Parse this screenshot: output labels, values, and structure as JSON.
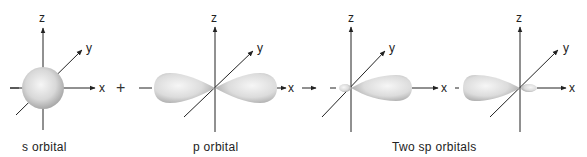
{
  "figure": {
    "panels": [
      {
        "id": "s",
        "label": "s orbital",
        "axes": {
          "x": "x",
          "y": "y",
          "z": "z"
        }
      },
      {
        "id": "p",
        "label": "p orbital",
        "axes": {
          "x": "x",
          "y": "y",
          "z": "z"
        }
      },
      {
        "id": "sp1",
        "axes": {
          "x": "x",
          "y": "y",
          "z": "z"
        }
      },
      {
        "id": "sp2",
        "axes": {
          "x": "x",
          "y": "y",
          "z": "z"
        }
      }
    ],
    "sp_label": "Two sp orbitals",
    "operators": {
      "plus": "+",
      "arrow": "→"
    },
    "colors": {
      "axis": "#222222",
      "orbital_light": "#f4f4f4",
      "orbital_dark": "#a8a8a8",
      "background": "#ffffff"
    }
  }
}
